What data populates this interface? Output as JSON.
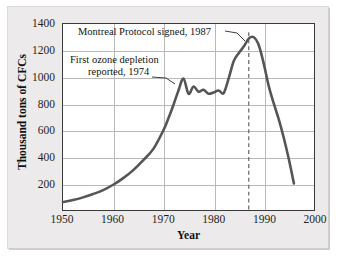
{
  "chart_data": {
    "type": "line",
    "title": "",
    "xlabel": "Year",
    "ylabel": "Thousand tons of CFCs",
    "xlim": [
      1950,
      2000
    ],
    "ylim": [
      0,
      1400
    ],
    "xticks": [
      1950,
      1960,
      1970,
      1980,
      1990,
      2000
    ],
    "yticks": [
      200,
      400,
      600,
      800,
      1000,
      1200,
      1400
    ],
    "grid": true,
    "legend": "none",
    "line_color": "#555555",
    "series": [
      {
        "name": "World CFC production",
        "x": [
          1950,
          1952,
          1954,
          1956,
          1958,
          1960,
          1962,
          1964,
          1966,
          1968,
          1970,
          1971,
          1972,
          1973,
          1974,
          1975,
          1976,
          1977,
          1978,
          1979,
          1980,
          1981,
          1982,
          1983,
          1984,
          1985,
          1986,
          1987,
          1988,
          1989,
          1990,
          1991,
          1992,
          1993,
          1994,
          1995,
          1996
        ],
        "y": [
          60,
          75,
          95,
          120,
          150,
          190,
          240,
          300,
          375,
          460,
          600,
          690,
          790,
          900,
          990,
          875,
          930,
          890,
          905,
          875,
          885,
          900,
          880,
          990,
          1120,
          1180,
          1230,
          1290,
          1300,
          1240,
          1100,
          930,
          800,
          680,
          540,
          380,
          200
        ]
      }
    ],
    "annotations": [
      {
        "id": "montreal",
        "text": "Montreal Protocol signed, 1987",
        "year": 1987,
        "value": 1300,
        "marker": "dashed-vertical-line"
      },
      {
        "id": "ozone",
        "line1": "First ozone depletion",
        "line2": "reported, 1974",
        "year": 1974,
        "value": 990,
        "marker": "leader-line"
      }
    ]
  },
  "axis": {
    "y_title": "Thousand tons of CFCs",
    "x_title": "Year",
    "y_tick_labels": [
      "1400",
      "1200",
      "1000",
      "800",
      "600",
      "400",
      "200"
    ],
    "x_tick_labels": [
      "1950",
      "1960",
      "1970",
      "1980",
      "1990",
      "2000"
    ]
  },
  "annotations": {
    "montreal": "Montreal Protocol signed, 1987",
    "ozone_line1": "First ozone depletion",
    "ozone_line2": "reported, 1974"
  }
}
